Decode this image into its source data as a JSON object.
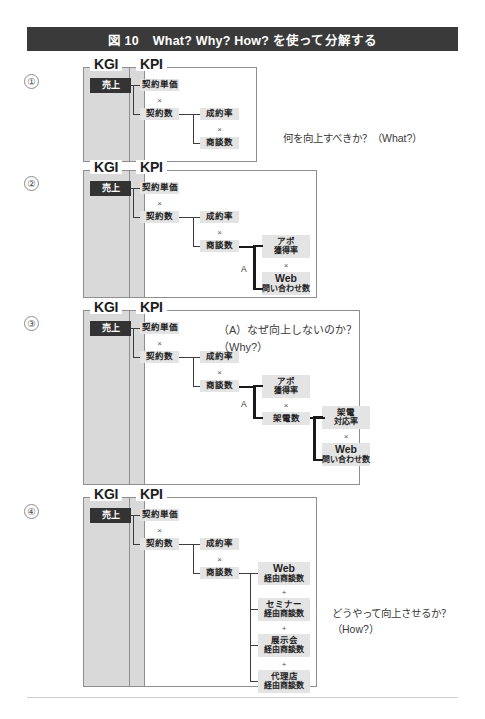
{
  "figure": {
    "title_number": "図 10",
    "title_text": "What? Why? How? を使って分解する"
  },
  "labels": {
    "kgi": "KGI",
    "kpi": "KPI",
    "times": "×",
    "plus": "+",
    "bracket_a": "A"
  },
  "panels": [
    {
      "number": "①",
      "kgi_node": "売上",
      "nodes": {
        "unit_price": "契約単価",
        "contracts": "契約数",
        "close_rate": "成約率",
        "meetings": "商談数"
      },
      "note": "何を向上すべきか？（What?）"
    },
    {
      "number": "②",
      "kgi_node": "売上",
      "nodes": {
        "unit_price": "契約単価",
        "contracts": "契約数",
        "close_rate": "成約率",
        "meetings": "商談数",
        "appt_rate_l1": "アポ",
        "appt_rate_l2": "獲得率",
        "web_inq_l1": "Web",
        "web_inq_l2": "問い合わせ数"
      },
      "note": ""
    },
    {
      "number": "③",
      "kgi_node": "売上",
      "nodes": {
        "unit_price": "契約単価",
        "contracts": "契約数",
        "close_rate": "成約率",
        "meetings": "商談数",
        "appt_rate_l1": "アポ",
        "appt_rate_l2": "獲得率",
        "calls": "架電数",
        "call_rate_l1": "架電",
        "call_rate_l2": "対応率",
        "web_inq_l1": "Web",
        "web_inq_l2": "問い合わせ数"
      },
      "note": "（A）なぜ向上しないのか？\n（Why?）"
    },
    {
      "number": "④",
      "kgi_node": "売上",
      "nodes": {
        "unit_price": "契約単価",
        "contracts": "契約数",
        "close_rate": "成約率",
        "meetings": "商談数",
        "web_l1": "Web",
        "web_l2": "経由商談数",
        "seminar_l1": "セミナー",
        "seminar_l2": "経由商談数",
        "expo_l1": "展示会",
        "expo_l2": "経由商談数",
        "agency_l1": "代理店",
        "agency_l2": "経由商談数"
      },
      "note": "どうやって向上させるか？\n（How?）"
    }
  ],
  "colors": {
    "title_bar": "#3a3a3a",
    "kgi_fill": "#d9d9d9",
    "chip_fill": "#e4e4e4",
    "chip_dark": "#333333",
    "line": "#3d3d3d",
    "border": "#8f8f8f"
  }
}
